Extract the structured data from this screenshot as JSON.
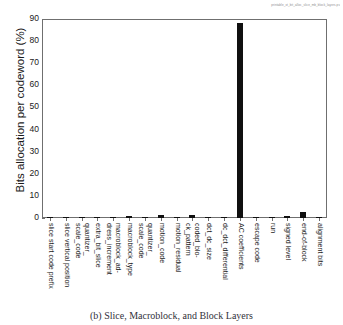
{
  "header_annotation": "printable_xt_bit_alloc_slice_mb_block_layers.ps",
  "caption": "(b) Slice, Macroblock, and Block Layers",
  "colors": {
    "bar": "#101010",
    "axis": "#6f6f6f",
    "text": "#1a1a1a"
  },
  "chart_data": {
    "type": "bar",
    "title": "",
    "xlabel": "",
    "ylabel": "Bits allocation per codeword (%)",
    "ylim": [
      0,
      90
    ],
    "yticks": [
      0,
      10,
      20,
      30,
      40,
      50,
      60,
      70,
      80,
      90
    ],
    "grid": false,
    "legend": false,
    "categories": [
      "slice start code prefix",
      "slice vertical position",
      "quantizer_scale_code",
      "extra_bit_slice",
      "macroblock_address_increment",
      "macroblock_type",
      "quantizer_scale_code",
      "motion_code",
      "motion_residual",
      "coded_block_pattern",
      "dct_dc_size",
      "dc_dct_differential",
      "AC coefficients",
      "escape code",
      "run",
      "signed level",
      "end-of-block",
      "alignment bits"
    ],
    "category_lines": [
      [
        "slice start code prefix"
      ],
      [
        "slice vertical position"
      ],
      [
        "quantizer_",
        "scale_code"
      ],
      [
        "extra_bit_slice"
      ],
      [
        "macroblock_ad-",
        "dress_increment"
      ],
      [
        "macroblock_type"
      ],
      [
        "quantizer_",
        "scale_code"
      ],
      [
        "motion_code"
      ],
      [
        "motion_residual"
      ],
      [
        "coded_blo-",
        "ck_pattern"
      ],
      [
        "dct_dc_size"
      ],
      [
        "dc_dct_differential"
      ],
      [
        "AC coefficients"
      ],
      [
        "escape code"
      ],
      [
        "run"
      ],
      [
        "signed level"
      ],
      [
        "end-of-block"
      ],
      [
        "alignment bits"
      ]
    ],
    "values": [
      0.5,
      0.3,
      0.15,
      0.1,
      0.5,
      1.0,
      0.6,
      1.3,
      0.1,
      1.4,
      0.4,
      0.2,
      88.0,
      0.5,
      0.4,
      1.0,
      2.6,
      0.1
    ]
  }
}
